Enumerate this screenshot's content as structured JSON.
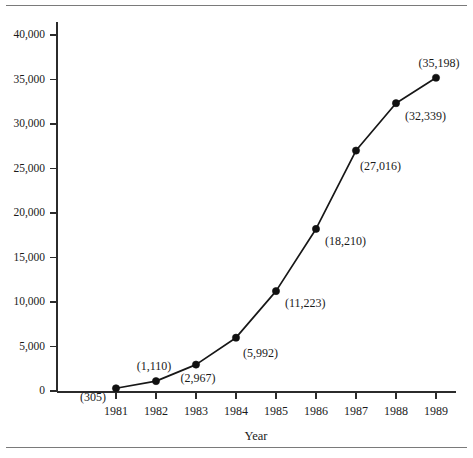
{
  "chart_data": {
    "type": "line",
    "title": "",
    "subtitle": "",
    "xlabel": "Year",
    "ylabel": "",
    "categories": [
      "1981",
      "1982",
      "1983",
      "1984",
      "1985",
      "1986",
      "1987",
      "1988",
      "1989"
    ],
    "x": [
      1981,
      1982,
      1983,
      1984,
      1985,
      1986,
      1987,
      1988,
      1989
    ],
    "values": [
      305,
      1110,
      2967,
      5992,
      11223,
      18210,
      27016,
      32339,
      35198
    ],
    "point_labels": [
      "(305)",
      "(1,110)",
      "(2,967)",
      "(5,992)",
      "(11,223)",
      "(18,210)",
      "(27,016)",
      "(32,339)",
      "(35,198)"
    ],
    "ylim": [
      0,
      40000
    ],
    "ytick_values": [
      0,
      5000,
      10000,
      15000,
      20000,
      25000,
      30000,
      35000,
      40000
    ],
    "ytick_labels": [
      "0",
      "5,000",
      "10,000",
      "15,000",
      "20,000",
      "25,000",
      "30,000",
      "35,000",
      "40,000"
    ],
    "xtick_labels": [
      "1981",
      "1982",
      "1983",
      "1984",
      "1985",
      "1986",
      "1987",
      "1988",
      "1989"
    ],
    "grid": false,
    "legend": false,
    "legend_position": "none",
    "series": [
      {
        "name": "series-1",
        "values": [
          305,
          1110,
          2967,
          5992,
          11223,
          18210,
          27016,
          32339,
          35198
        ],
        "marker": "filled-circle",
        "line_color": "#171717",
        "marker_color": "#111111"
      }
    ]
  },
  "colors": {
    "background": "#ffffff",
    "axis": "#2b2b2b",
    "line": "#171717",
    "marker": "#111111",
    "text": "#1a1a1a",
    "rule": "#7a7a7a"
  },
  "label_offsets": [
    {
      "dx": -10,
      "dy": 13,
      "anchor": "end"
    },
    {
      "dx": -2,
      "dy": -11,
      "anchor": "middle"
    },
    {
      "dx": 2,
      "dy": 17,
      "anchor": "middle"
    },
    {
      "dx": 7,
      "dy": 19,
      "anchor": "start"
    },
    {
      "dx": 9,
      "dy": 16,
      "anchor": "start"
    },
    {
      "dx": 9,
      "dy": 16,
      "anchor": "start"
    },
    {
      "dx": 4,
      "dy": 19,
      "anchor": "start"
    },
    {
      "dx": 9,
      "dy": 17,
      "anchor": "start"
    },
    {
      "dx": 3,
      "dy": -11,
      "anchor": "middle"
    }
  ]
}
